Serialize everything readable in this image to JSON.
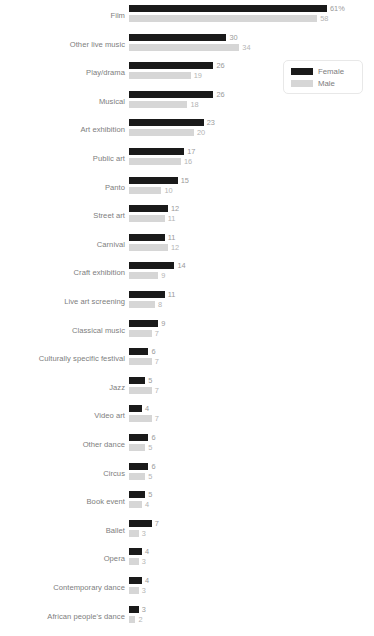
{
  "chart_data": {
    "type": "bar",
    "orientation": "horizontal",
    "title": "",
    "xlabel": "",
    "ylabel": "",
    "grid": false,
    "legend_position": "top-right",
    "xlim": [
      0,
      61
    ],
    "categories": [
      "Film",
      "Other live music",
      "Play/drama",
      "Musical",
      "Art exhibition",
      "Public art",
      "Panto",
      "Street art",
      "Carnival",
      "Craft exhibition",
      "Live art screening",
      "Classical music",
      "Culturally specific festival",
      "Jazz",
      "Video art",
      "Other dance",
      "Circus",
      "Book event",
      "Ballet",
      "Opera",
      "Contemporary dance",
      "African people's dance"
    ],
    "series": [
      {
        "name": "Female",
        "color": "#1a1a1a",
        "values": [
          61,
          30,
          26,
          26,
          23,
          17,
          15,
          12,
          11,
          14,
          11,
          9,
          6,
          5,
          4,
          6,
          6,
          5,
          7,
          4,
          4,
          3
        ],
        "labels": [
          "61%",
          "30",
          "26",
          "26",
          "23",
          "17",
          "15",
          "12",
          "11",
          "14",
          "11",
          "9",
          "6",
          "5",
          "4",
          "6",
          "6",
          "5",
          "7",
          "4",
          "4",
          "3"
        ]
      },
      {
        "name": "Male",
        "color": "#d6d6d6",
        "values": [
          58,
          34,
          19,
          18,
          20,
          16,
          10,
          11,
          12,
          9,
          8,
          7,
          7,
          7,
          7,
          5,
          5,
          4,
          3,
          3,
          3,
          2
        ],
        "labels": [
          "58",
          "34",
          "19",
          "18",
          "20",
          "16",
          "10",
          "11",
          "12",
          "9",
          "8",
          "7",
          "7",
          "7",
          "7",
          "5",
          "5",
          "4",
          "3",
          "3",
          "3",
          "2"
        ]
      }
    ]
  },
  "legend": {
    "items": [
      {
        "label": "Female",
        "swatch": "female"
      },
      {
        "label": "Male",
        "swatch": "male"
      }
    ]
  }
}
